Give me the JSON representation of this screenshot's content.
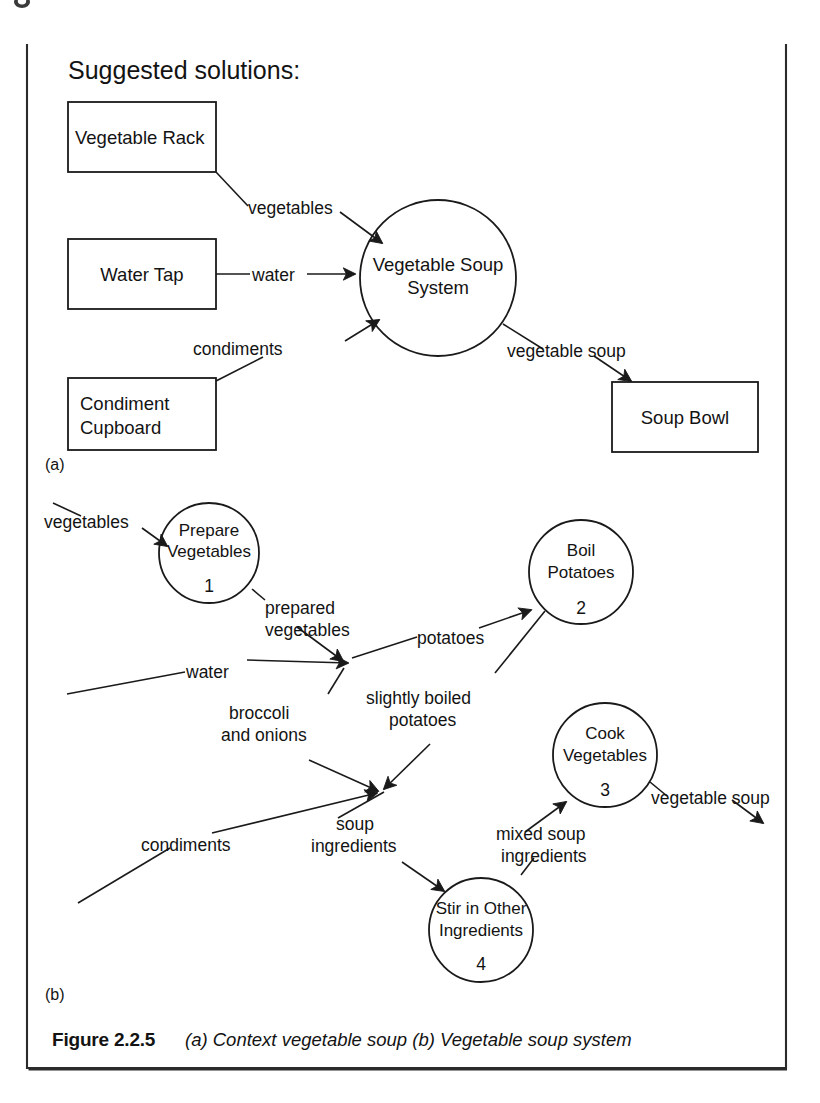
{
  "figure": {
    "heading": "Suggested solutions:",
    "part_a_label": "(a)",
    "part_b_label": "(b)",
    "caption_number": "Figure 2.2.5",
    "caption_text": "(a) Context vegetable soup (b) Vegetable soup system"
  },
  "diagram_a": {
    "type": "context-data-flow-diagram",
    "entities": [
      {
        "id": "vegetable-rack",
        "label": "Vegetable Rack",
        "shape": "rectangle"
      },
      {
        "id": "water-tap",
        "label": "Water Tap",
        "shape": "rectangle"
      },
      {
        "id": "condiment-cupboard",
        "label_line1": "Condiment",
        "label_line2": "Cupboard",
        "shape": "rectangle"
      },
      {
        "id": "soup-bowl",
        "label": "Soup Bowl",
        "shape": "rectangle"
      }
    ],
    "process": {
      "id": "vegetable-soup-system",
      "label_line1": "Vegetable Soup",
      "label_line2": "System",
      "shape": "circle"
    },
    "flows": [
      {
        "id": "flow-vegetables",
        "label": "vegetables",
        "from": "vegetable-rack",
        "to": "vegetable-soup-system"
      },
      {
        "id": "flow-water",
        "label": "water",
        "from": "water-tap",
        "to": "vegetable-soup-system"
      },
      {
        "id": "flow-condiments",
        "label": "condiments",
        "from": "condiment-cupboard",
        "to": "vegetable-soup-system"
      },
      {
        "id": "flow-vegetable-soup",
        "label": "vegetable soup",
        "from": "vegetable-soup-system",
        "to": "soup-bowl"
      }
    ]
  },
  "diagram_b": {
    "type": "level-1-data-flow-diagram",
    "processes": [
      {
        "id": "prepare-vegetables",
        "label_line1": "Prepare",
        "label_line2": "Vegetables",
        "number": "1"
      },
      {
        "id": "boil-potatoes",
        "label_line1": "Boil",
        "label_line2": "Potatoes",
        "number": "2"
      },
      {
        "id": "cook-vegetables",
        "label_line1": "Cook",
        "label_line2": "Vegetables",
        "number": "3"
      },
      {
        "id": "stir-in-other-ingredients",
        "label_line1": "Stir in Other",
        "label_line2": "Ingredients",
        "number": "4"
      }
    ],
    "flows": [
      {
        "id": "flow-b-vegetables",
        "label": "vegetables"
      },
      {
        "id": "flow-b-prepared-vegetables",
        "label_line1": "prepared",
        "label_line2": "vegetables"
      },
      {
        "id": "flow-b-water",
        "label": "water"
      },
      {
        "id": "flow-b-potatoes",
        "label": "potatoes"
      },
      {
        "id": "flow-b-slightly-boiled-potatoes",
        "label_line1": "slightly boiled",
        "label_line2": "potatoes"
      },
      {
        "id": "flow-b-broccoli-and-onions",
        "label_line1": "broccoli",
        "label_line2": "and onions"
      },
      {
        "id": "flow-b-condiments",
        "label": "condiments"
      },
      {
        "id": "flow-b-soup-ingredients",
        "label_line1": "soup",
        "label_line2": "ingredients"
      },
      {
        "id": "flow-b-mixed-soup-ingredients",
        "label_line1": "mixed soup",
        "label_line2": "ingredients"
      },
      {
        "id": "flow-b-vegetable-soup",
        "label": "vegetable soup"
      }
    ]
  },
  "colors": {
    "ink": "#1a1a1a",
    "paper": "#ffffff",
    "frame": "#2b2b2b"
  }
}
